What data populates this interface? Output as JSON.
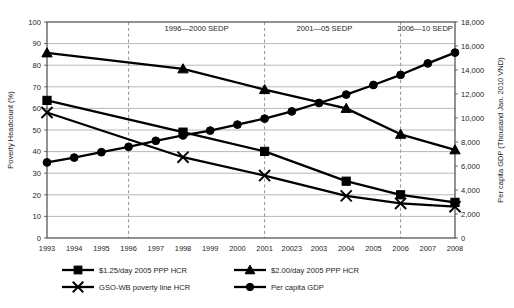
{
  "chart_data": {
    "type": "line",
    "title": "",
    "xlabel": "",
    "ylabel": "Poverty Headcount (%)",
    "y2label": "Per capita GDP (Thousand Jan. 2010 VND)",
    "ylim": [
      0,
      100
    ],
    "y2lim": [
      0,
      18000
    ],
    "grid": true,
    "legend_position": "bottom",
    "x": [
      1993,
      1994,
      1995,
      1996,
      1997,
      1998,
      1999,
      2000,
      2001,
      2002,
      2003,
      2004,
      2005,
      2006,
      2007,
      2008
    ],
    "xtick_labels": [
      "1993",
      "1994",
      "1995",
      "1996",
      "1997",
      "1998",
      "1999",
      "2000",
      "2001",
      "20023",
      "2003",
      "2004",
      "2005",
      "2006",
      "2007",
      "2008"
    ],
    "ytick_labels": [
      "0",
      "10",
      "20",
      "30",
      "40",
      "50",
      "60",
      "70",
      "80",
      "90",
      "100"
    ],
    "ytick_values": [
      0,
      10,
      20,
      30,
      40,
      50,
      60,
      70,
      80,
      90,
      100
    ],
    "y2tick_labels": [
      "0",
      "2,000",
      "4,000",
      "6,000",
      "8,000",
      "10,000",
      "12,000",
      "14,000",
      "16,000",
      "18,000"
    ],
    "y2tick_values": [
      0,
      2000,
      4000,
      6000,
      8000,
      10000,
      12000,
      14000,
      16000,
      18000
    ],
    "annotations": [
      {
        "text": "1996—2000 SEDP",
        "x_center": 1998.5
      },
      {
        "text": "2001—05 SEDP",
        "x_center": 2003.2
      },
      {
        "text": "2006—10 SEDP",
        "x_center": 2006.9
      }
    ],
    "dividers_at_x": [
      1996,
      2001,
      2006
    ],
    "series": [
      {
        "name": "$1.25/day 2005 PPP HCR",
        "marker": "square",
        "axis": "left",
        "values": [
          63.7,
          null,
          null,
          null,
          null,
          49.0,
          null,
          null,
          40.1,
          null,
          null,
          26.3,
          null,
          20.0,
          null,
          16.5
        ]
      },
      {
        "name": "$2.00/day 2005 PPP HCR",
        "marker": "triangle",
        "axis": "left",
        "values": [
          85.7,
          null,
          null,
          null,
          null,
          78.3,
          null,
          null,
          68.7,
          null,
          null,
          60.0,
          null,
          48.0,
          null,
          40.8
        ]
      },
      {
        "name": "GSO-WB poverty line HCR",
        "marker": "cross",
        "axis": "left",
        "values": [
          58.1,
          null,
          null,
          null,
          null,
          37.4,
          null,
          null,
          28.9,
          null,
          null,
          19.5,
          null,
          16.0,
          null,
          14.5
        ]
      },
      {
        "name": "Per capita GDP",
        "marker": "circle",
        "axis": "right",
        "values": [
          6300,
          6700,
          7150,
          7600,
          8100,
          8550,
          8950,
          9450,
          9950,
          10550,
          11250,
          11950,
          12750,
          13600,
          14550,
          15450
        ]
      }
    ]
  },
  "legend": {
    "entries": [
      {
        "label": "$1.25/day 2005 PPP HCR",
        "marker": "square"
      },
      {
        "label": "$2.00/day 2005 PPP HCR",
        "marker": "triangle"
      },
      {
        "label": "GSO-WB poverty line HCR",
        "marker": "cross"
      },
      {
        "label": "Per capita GDP",
        "marker": "circle"
      }
    ]
  }
}
